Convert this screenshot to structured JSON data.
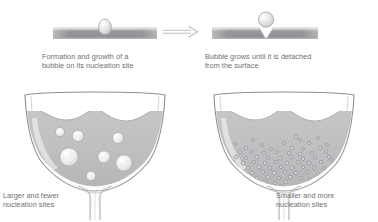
{
  "figure": {
    "background_color": "#ffffff",
    "text_color": "#6d6f72",
    "liquid_color": "#bcbdbf",
    "surface_color": "#9a9c9e",
    "outline_color": "#8d8f91"
  },
  "top_row": {
    "left_panel": {
      "caption": "Formation and growth of a\nbubble on its nucleation site",
      "surface_label": "heated-surface-bar",
      "bubble_label": "teardrop-bubble-attached"
    },
    "arrow": {
      "label": "process-arrow",
      "direction": "right"
    },
    "right_panel": {
      "caption": "Bubble grows until it is detached\nfrom the surface",
      "surface_label": "heated-surface-bar-with-cavity",
      "bubble_label": "round-bubble-detached"
    }
  },
  "bottom_row": {
    "left_glass": {
      "caption": "Larger and fewer\nnucleation sites",
      "bubble_count": 7,
      "bubble_size": "large",
      "bubbles": [
        {
          "cx": 60,
          "cy": 132,
          "r": 4.6
        },
        {
          "cx": 78,
          "cy": 136,
          "r": 5.8
        },
        {
          "cx": 118,
          "cy": 138,
          "r": 5.6
        },
        {
          "cx": 69,
          "cy": 157,
          "r": 9.2
        },
        {
          "cx": 104,
          "cy": 157,
          "r": 6.2
        },
        {
          "cx": 124,
          "cy": 163,
          "r": 8.2
        },
        {
          "cx": 91,
          "cy": 176,
          "r": 4.8
        }
      ]
    },
    "right_glass": {
      "caption": "Smaller and more\nnucleation sites",
      "bubble_count": 78,
      "bubble_size": "small",
      "bubbles": [
        {
          "cx": 253,
          "cy": 140,
          "r": 1.5
        },
        {
          "cx": 296,
          "cy": 137,
          "r": 1.7
        },
        {
          "cx": 262,
          "cy": 145,
          "r": 1.4
        },
        {
          "cx": 284,
          "cy": 143,
          "r": 1.5
        },
        {
          "cx": 309,
          "cy": 143,
          "r": 1.6
        },
        {
          "cx": 246,
          "cy": 148,
          "r": 1.8
        },
        {
          "cx": 271,
          "cy": 149,
          "r": 1.5
        },
        {
          "cx": 292,
          "cy": 148,
          "r": 1.8
        },
        {
          "cx": 303,
          "cy": 149,
          "r": 1.4
        },
        {
          "cx": 320,
          "cy": 148,
          "r": 1.7
        },
        {
          "cx": 240,
          "cy": 152,
          "r": 1.6
        },
        {
          "cx": 252,
          "cy": 152,
          "r": 1.5
        },
        {
          "cx": 264,
          "cy": 153,
          "r": 1.7
        },
        {
          "cx": 277,
          "cy": 152,
          "r": 1.5
        },
        {
          "cx": 289,
          "cy": 153,
          "r": 1.6
        },
        {
          "cx": 300,
          "cy": 154,
          "r": 1.8
        },
        {
          "cx": 312,
          "cy": 153,
          "r": 1.5
        },
        {
          "cx": 326,
          "cy": 152,
          "r": 1.6
        },
        {
          "cx": 236,
          "cy": 157,
          "r": 1.9
        },
        {
          "cx": 246,
          "cy": 158,
          "r": 1.6
        },
        {
          "cx": 257,
          "cy": 157,
          "r": 1.8
        },
        {
          "cx": 268,
          "cy": 158,
          "r": 1.5
        },
        {
          "cx": 280,
          "cy": 158,
          "r": 1.9
        },
        {
          "cx": 291,
          "cy": 157,
          "r": 1.6
        },
        {
          "cx": 303,
          "cy": 159,
          "r": 1.7
        },
        {
          "cx": 315,
          "cy": 158,
          "r": 1.5
        },
        {
          "cx": 329,
          "cy": 157,
          "r": 1.6
        },
        {
          "cx": 233,
          "cy": 162,
          "r": 1.7
        },
        {
          "cx": 243,
          "cy": 163,
          "r": 2.0
        },
        {
          "cx": 254,
          "cy": 162,
          "r": 1.6
        },
        {
          "cx": 265,
          "cy": 163,
          "r": 1.8
        },
        {
          "cx": 276,
          "cy": 162,
          "r": 1.6
        },
        {
          "cx": 287,
          "cy": 163,
          "r": 1.9
        },
        {
          "cx": 298,
          "cy": 162,
          "r": 1.6
        },
        {
          "cx": 309,
          "cy": 163,
          "r": 1.8
        },
        {
          "cx": 321,
          "cy": 162,
          "r": 1.6
        },
        {
          "cx": 237,
          "cy": 167,
          "r": 1.8
        },
        {
          "cx": 248,
          "cy": 168,
          "r": 1.6
        },
        {
          "cx": 259,
          "cy": 167,
          "r": 2.0
        },
        {
          "cx": 270,
          "cy": 168,
          "r": 1.7
        },
        {
          "cx": 281,
          "cy": 167,
          "r": 1.6
        },
        {
          "cx": 292,
          "cy": 168,
          "r": 1.9
        },
        {
          "cx": 303,
          "cy": 167,
          "r": 1.6
        },
        {
          "cx": 314,
          "cy": 168,
          "r": 1.7
        },
        {
          "cx": 241,
          "cy": 172,
          "r": 1.7
        },
        {
          "cx": 252,
          "cy": 173,
          "r": 1.9
        },
        {
          "cx": 263,
          "cy": 172,
          "r": 1.6
        },
        {
          "cx": 274,
          "cy": 173,
          "r": 2.0
        },
        {
          "cx": 285,
          "cy": 172,
          "r": 1.6
        },
        {
          "cx": 296,
          "cy": 173,
          "r": 1.8
        },
        {
          "cx": 307,
          "cy": 172,
          "r": 1.6
        },
        {
          "cx": 246,
          "cy": 177,
          "r": 1.8
        },
        {
          "cx": 257,
          "cy": 178,
          "r": 1.6
        },
        {
          "cx": 268,
          "cy": 177,
          "r": 1.9
        },
        {
          "cx": 279,
          "cy": 178,
          "r": 1.6
        },
        {
          "cx": 290,
          "cy": 177,
          "r": 1.8
        },
        {
          "cx": 301,
          "cy": 178,
          "r": 1.6
        },
        {
          "cx": 253,
          "cy": 182,
          "r": 1.7
        },
        {
          "cx": 264,
          "cy": 182,
          "r": 1.9
        },
        {
          "cx": 275,
          "cy": 183,
          "r": 1.6
        },
        {
          "cx": 286,
          "cy": 182,
          "r": 1.8
        },
        {
          "cx": 259,
          "cy": 186,
          "r": 1.6
        },
        {
          "cx": 270,
          "cy": 187,
          "r": 1.8
        },
        {
          "cx": 281,
          "cy": 186,
          "r": 1.5
        },
        {
          "cx": 300,
          "cy": 140,
          "r": 1.3
        },
        {
          "cx": 318,
          "cy": 138,
          "r": 1.4
        },
        {
          "cx": 235,
          "cy": 144,
          "r": 1.3
        },
        {
          "cx": 327,
          "cy": 145,
          "r": 1.4
        },
        {
          "cx": 332,
          "cy": 160,
          "r": 1.5
        },
        {
          "cx": 229,
          "cy": 167,
          "r": 1.5
        },
        {
          "cx": 324,
          "cy": 168,
          "r": 1.5
        },
        {
          "cx": 318,
          "cy": 174,
          "r": 1.4
        },
        {
          "cx": 236,
          "cy": 178,
          "r": 1.4
        },
        {
          "cx": 310,
          "cy": 179,
          "r": 1.4
        },
        {
          "cx": 248,
          "cy": 187,
          "r": 1.4
        },
        {
          "cx": 292,
          "cy": 188,
          "r": 1.4
        },
        {
          "cx": 266,
          "cy": 191,
          "r": 1.4
        },
        {
          "cx": 277,
          "cy": 191,
          "r": 1.3
        }
      ]
    }
  }
}
